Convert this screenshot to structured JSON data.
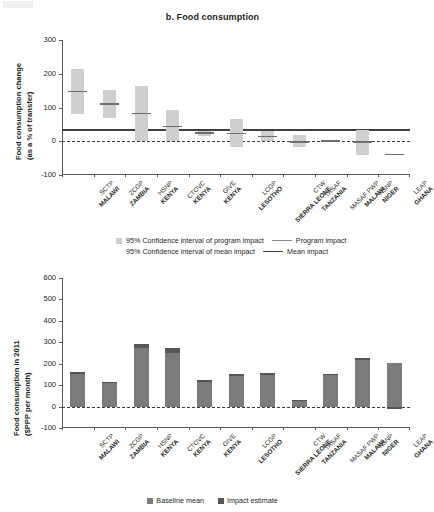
{
  "panels": [
    {
      "id": "top",
      "title": "b. Food consumption",
      "ylabel_line1": "Food consumption change",
      "ylabel_line2": "(as a % of transfer)",
      "yticks": [
        "300",
        "200",
        "100",
        "0",
        "-100"
      ]
    },
    {
      "id": "bottom",
      "title": "",
      "ylabel_line1": "Food consumption in 2011",
      "ylabel_line2": "($PPP per month)",
      "yticks": [
        "600",
        "500",
        "400",
        "300",
        "200",
        "100",
        "0",
        "-100"
      ]
    }
  ],
  "categories": [
    {
      "program": "SCTP",
      "country": "MALAWI"
    },
    {
      "program": "ZCGP",
      "country": "ZAMBIA"
    },
    {
      "program": "HSNP",
      "country": "KENYA"
    },
    {
      "program": "CTOVC",
      "country": "KENYA"
    },
    {
      "program": "GIVE",
      "country": "KENYA"
    },
    {
      "program": "LCGP",
      "country": "LESOTHO"
    },
    {
      "program": "CTW",
      "country": "SIERRA LEONE"
    },
    {
      "program": "TASAF",
      "country": "TANZANIA"
    },
    {
      "program": "MASAF PWP",
      "country": "MALAWI"
    },
    {
      "program": "NSNP",
      "country": "NIGER"
    },
    {
      "program": "LEAP",
      "country": "GHANA"
    }
  ],
  "legend_top": {
    "ci_program": "95% Confidence interval of program impact",
    "ci_mean": "95% Confidence interval of mean impact",
    "program_impact": "Program impact",
    "mean_impact": "Mean impact"
  },
  "legend_bottom": {
    "baseline": "Baseline mean",
    "impact": "Impact estimate"
  },
  "colors": {
    "ci_box": "#cfcfcf",
    "program_mark": "#6d6d6d",
    "program_line": "#8a8a8a",
    "mean_line": "#3f3f3f",
    "bar_baseline": "#7b7b7b",
    "bar_impact": "#565656",
    "axis": "#5a5a5a",
    "text": "#231f20"
  },
  "chart_data": [
    {
      "type": "bar",
      "title": "b. Food consumption",
      "xlabel": "",
      "ylabel": "Food consumption change (as a % of transfer)",
      "ylim": [
        -100,
        300
      ],
      "yticks": [
        -100,
        0,
        100,
        200,
        300
      ],
      "grid": false,
      "legend_position": "below",
      "categories": [
        "SCTP MALAWI",
        "ZCGP ZAMBIA",
        "HSNP KENYA",
        "CTOVC KENYA",
        "GIVE KENYA",
        "LCGP LESOTHO",
        "CTW SIERRA LEONE",
        "TASAF TANZANIA",
        "MASAF PWP MALAWI",
        "NSNP NIGER",
        "LEAP GHANA"
      ],
      "series": [
        {
          "name": "Program impact",
          "values": [
            148,
            110,
            82,
            44,
            24,
            23,
            14,
            -3,
            1,
            -2,
            -39
          ]
        },
        {
          "name": "95% CI lower",
          "values": [
            80,
            68,
            0,
            0,
            17,
            -18,
            2,
            -17,
            1,
            -40,
            -39
          ]
        },
        {
          "name": "95% CI upper",
          "values": [
            213,
            151,
            163,
            93,
            30,
            66,
            29,
            19,
            1,
            32,
            -39
          ]
        }
      ],
      "annotations": [
        {
          "name": "Program impact reference line",
          "type": "hline",
          "value": 33,
          "style": "solid-light"
        },
        {
          "name": "Mean impact reference line",
          "type": "hline",
          "value": 36,
          "style": "solid-dark"
        },
        {
          "name": "Zero line",
          "type": "hline",
          "value": 0,
          "style": "dashed"
        }
      ]
    },
    {
      "type": "bar",
      "title": "",
      "xlabel": "",
      "ylabel": "Food consumption in 2011 ($PPP per month)",
      "ylim": [
        -100,
        600
      ],
      "yticks": [
        -100,
        0,
        100,
        200,
        300,
        400,
        500,
        600
      ],
      "grid": false,
      "legend_position": "below",
      "stacked": true,
      "categories": [
        "SCTP MALAWI",
        "ZCGP ZAMBIA",
        "HSNP KENYA",
        "CTOVC KENYA",
        "GIVE KENYA",
        "LCGP LESOTHO",
        "CTW SIERRA LEONE",
        "TASAF TANZANIA",
        "MASAF PWP MALAWI",
        "NSNP NIGER",
        "LEAP GHANA"
      ],
      "series": [
        {
          "name": "Baseline mean",
          "values": [
            150,
            108,
            272,
            252,
            114,
            143,
            146,
            27,
            146,
            216,
            205
          ]
        },
        {
          "name": "Impact estimate",
          "values": [
            12,
            9,
            20,
            22,
            8,
            9,
            12,
            4,
            8,
            12,
            -10
          ]
        }
      ],
      "annotations": [
        {
          "name": "Zero line",
          "type": "hline",
          "value": 0,
          "style": "dashed"
        }
      ]
    }
  ]
}
